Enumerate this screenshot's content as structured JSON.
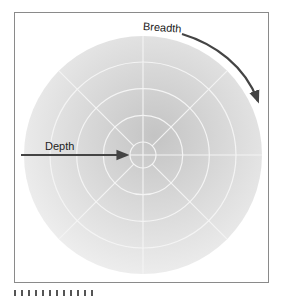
{
  "diagram": {
    "labels": {
      "breadth": "Breadth",
      "depth": "Depth"
    },
    "caption": "",
    "rings": 5,
    "spokes": 8,
    "colors": {
      "frame": "#8a8a8a",
      "disk_center": "#c4c4c4",
      "disk_edge": "#efefef",
      "grid_lines": "#f4f4f4",
      "arrows": "#444444"
    }
  }
}
